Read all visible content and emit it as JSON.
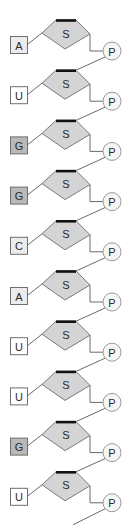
{
  "diagram": {
    "sugar_label": "S",
    "phosphate_label": "P",
    "colors": {
      "sugar_fill": "#d4d4d4",
      "sugar_top_edge": "#111111",
      "purine_G_fill": "#b9b9b9",
      "base_light_fill": "#ececec",
      "base_white_fill": "#ffffff",
      "phosphate_fill": "#f6f6f6",
      "line": "#6a6a6a"
    },
    "nucleotides": [
      {
        "base": "A",
        "sugar": "S",
        "phosphate": "P",
        "base_fill": "#ececec"
      },
      {
        "base": "U",
        "sugar": "S",
        "phosphate": "P",
        "base_fill": "#ffffff"
      },
      {
        "base": "G",
        "sugar": "S",
        "phosphate": "P",
        "base_fill": "#b9b9b9"
      },
      {
        "base": "G",
        "sugar": "S",
        "phosphate": "P",
        "base_fill": "#b9b9b9"
      },
      {
        "base": "C",
        "sugar": "S",
        "phosphate": "P",
        "base_fill": "#ececec"
      },
      {
        "base": "A",
        "sugar": "S",
        "phosphate": "P",
        "base_fill": "#ececec"
      },
      {
        "base": "U",
        "sugar": "S",
        "phosphate": "P",
        "base_fill": "#ffffff"
      },
      {
        "base": "U",
        "sugar": "S",
        "phosphate": "P",
        "base_fill": "#ffffff"
      },
      {
        "base": "G",
        "sugar": "S",
        "phosphate": "P",
        "base_fill": "#b9b9b9"
      },
      {
        "base": "U",
        "sugar": "S",
        "phosphate": "P",
        "base_fill": "#ffffff"
      }
    ],
    "layout": {
      "first_unit_top": 20,
      "unit_spacing": 50.2
    }
  }
}
